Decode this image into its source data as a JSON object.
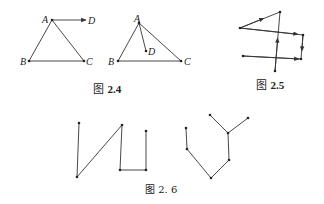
{
  "figures": {
    "fig_2_4": {
      "caption_prefix": "图",
      "caption_number": "2.4",
      "left": {
        "labels": {
          "A": "A",
          "B": "B",
          "C": "C",
          "D": "D"
        }
      },
      "right": {
        "labels": {
          "A": "A",
          "B": "B",
          "C": "C",
          "D": "D"
        }
      }
    },
    "fig_2_5": {
      "caption_prefix": "图",
      "caption_number": "2.5"
    },
    "fig_2_6": {
      "caption_prefix": "图",
      "caption_number": "2. 6"
    }
  },
  "colors": {
    "line": "#333333",
    "text": "#222222",
    "background": "#ffffff"
  }
}
